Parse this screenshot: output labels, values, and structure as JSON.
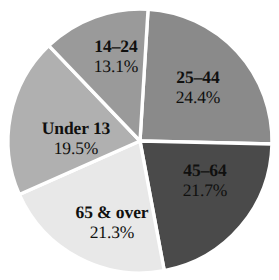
{
  "chart_data": {
    "type": "pie",
    "title": "",
    "subtitle": "",
    "xlabel": "",
    "ylabel": "",
    "legend": "none",
    "grid": false,
    "value_unit": "percent",
    "center": {
      "x": 140,
      "y": 141
    },
    "radius": 132,
    "separator_color": "#ffffff",
    "background_color": "#ffffff",
    "label_color": "#10100f",
    "categories": [
      "25–44",
      "45–64",
      "65 & over",
      "Under 13",
      "14–24"
    ],
    "values": [
      24.4,
      21.7,
      21.3,
      19.5,
      13.1
    ],
    "slices": [
      {
        "label": "25–44",
        "value": 24.4,
        "percent_text": "24.4%",
        "color": "#8a8a8a",
        "start_angle": 3.5,
        "end_angle": 91.3,
        "label_x": 198,
        "label_y": 87
      },
      {
        "label": "45–64",
        "value": 21.7,
        "percent_text": "21.7%",
        "color": "#4a4a4a",
        "start_angle": 91.3,
        "end_angle": 169.4,
        "label_x": 205,
        "label_y": 180
      },
      {
        "label": "65 & over",
        "value": 21.3,
        "percent_text": "21.3%",
        "color": "#e8e8e8",
        "start_angle": 169.4,
        "end_angle": 246.1,
        "label_x": 112,
        "label_y": 222
      },
      {
        "label": "Under 13",
        "value": 19.5,
        "percent_text": "19.5%",
        "color": "#b0b0b0",
        "start_angle": 246.1,
        "end_angle": 316.3,
        "label_x": 76,
        "label_y": 138
      },
      {
        "label": "14–24",
        "value": 13.1,
        "percent_text": "13.1%",
        "color": "#9a9a9a",
        "start_angle": 316.3,
        "end_angle": 363.5,
        "label_x": 116,
        "label_y": 56
      }
    ]
  }
}
